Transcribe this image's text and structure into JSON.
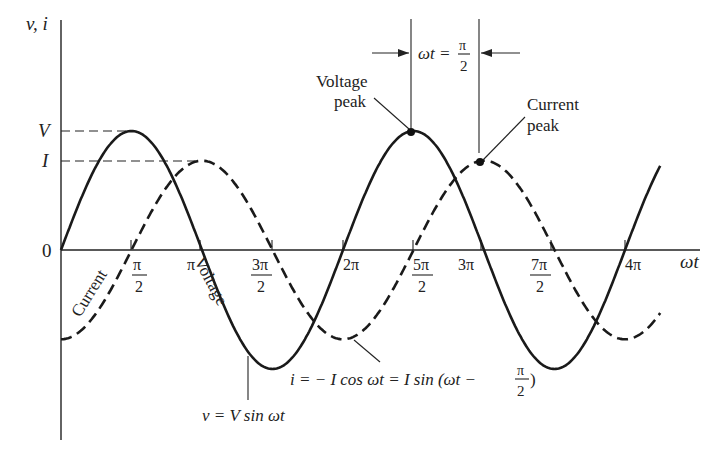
{
  "figure": {
    "y_axis_label": "v, i",
    "x_axis_label": "ωt",
    "origin_label": "0",
    "v_level_label": "V",
    "i_level_label": "I",
    "ticks": [
      {
        "num": "π",
        "den": "2",
        "x": 131
      },
      {
        "num": "π",
        "den": "",
        "x": 200
      },
      {
        "num": "3π",
        "den": "2",
        "x": 272
      },
      {
        "num": "2π",
        "den": "",
        "x": 343
      },
      {
        "num": "5π",
        "den": "2",
        "x": 413
      },
      {
        "num": "3π",
        "den": "",
        "x": 481
      },
      {
        "num": "7π",
        "den": "2",
        "x": 551
      },
      {
        "num": "4π",
        "den": "",
        "x": 625
      }
    ],
    "curve_labels": {
      "current": "Current",
      "voltage": "Voltage"
    },
    "annotations": {
      "voltage_peak": [
        "Voltage",
        "peak"
      ],
      "current_peak": [
        "Current",
        "peak"
      ],
      "phase_shift_lhs": "ωt =",
      "phase_shift_num": "π",
      "phase_shift_den": "2",
      "voltage_equation": "v = V sin ωt",
      "current_equation_main": "i = − I cos ωt = I sin (ωt −",
      "current_equation_num": "π",
      "current_equation_den": "2",
      "current_equation_close": ")"
    }
  },
  "chart_data": {
    "type": "line",
    "title": "",
    "xlabel": "ωt",
    "ylabel": "v, i",
    "x_range_rad": [
      0,
      4.25
    ],
    "x_units": "multiples of π",
    "x_tick_labels": [
      "π/2",
      "π",
      "3π/2",
      "2π",
      "5π/2",
      "3π",
      "7π/2",
      "4π"
    ],
    "y_tick_labels": [
      "0",
      "I",
      "V"
    ],
    "series": [
      {
        "name": "Voltage",
        "expression": "v = V sin ωt",
        "amplitude": "V",
        "style": "solid",
        "peaks_at": [
          "π/2",
          "5π/2"
        ],
        "troughs_at": [
          "3π/2",
          "7π/2"
        ]
      },
      {
        "name": "Current",
        "expression": "i = −I cos ωt = I sin(ωt − π/2)",
        "amplitude": "I",
        "style": "dashed",
        "peaks_at": [
          "π",
          "3π"
        ],
        "troughs_at": [
          "0",
          "2π",
          "4π"
        ]
      }
    ],
    "relative_amplitude": {
      "V": 1.0,
      "I": 0.75
    },
    "phase_shift": "π/2 (current lags voltage)",
    "grid": false,
    "legend": "none (inline labels)"
  }
}
